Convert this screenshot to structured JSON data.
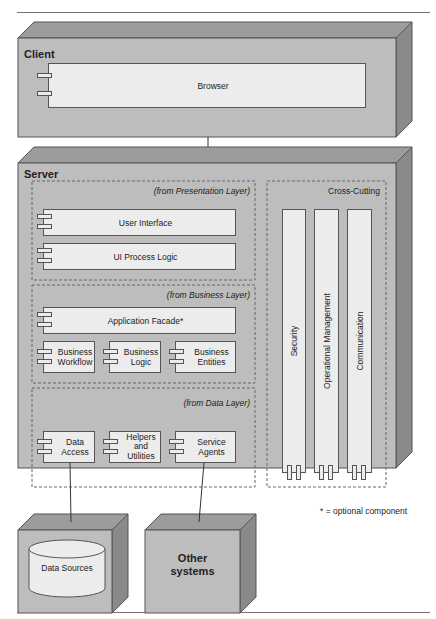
{
  "diagram": {
    "type": "deployment",
    "colors": {
      "node_front": "#bdbdbd",
      "node_top": "#9c9c9c",
      "node_side": "#8a8a8a",
      "component_fill": "#ececec",
      "border": "#555555",
      "dashed": "#666666"
    },
    "client": {
      "title": "Client",
      "components": [
        {
          "label": "Browser"
        }
      ]
    },
    "server": {
      "title": "Server",
      "packages": {
        "presentation": {
          "label": "(from Presentation Layer)",
          "components": [
            {
              "label": "User Interface"
            },
            {
              "label": "UI Process Logic"
            }
          ]
        },
        "business": {
          "label": "(from Business Layer)",
          "components": [
            {
              "label": "Application Facade*"
            },
            {
              "label": "Business Workflow"
            },
            {
              "label": "Business Logic"
            },
            {
              "label": "Business Entities"
            }
          ]
        },
        "data": {
          "label": "(from Data Layer)",
          "components": [
            {
              "label": "Data Access"
            },
            {
              "label": "Helpers and Utilities"
            },
            {
              "label": "Service Agents"
            }
          ]
        },
        "cross_cutting": {
          "label": "Cross-Cutting",
          "components": [
            {
              "label": "Security"
            },
            {
              "label": "Operational Management"
            },
            {
              "label": "Communication"
            }
          ]
        }
      }
    },
    "external": {
      "data_sources": {
        "label": "Data Sources"
      },
      "other_systems": {
        "label_line1": "Other",
        "label_line2": "systems"
      }
    },
    "legend": {
      "text": "* = optional component"
    },
    "text_lines": {
      "business_workflow": [
        "Business",
        "Workflow"
      ],
      "business_logic": [
        "Business",
        "Logic"
      ],
      "business_entities": [
        "Business",
        "Entities"
      ],
      "data_access": [
        "Data",
        "Access"
      ],
      "helpers": [
        "Helpers",
        "and",
        "Utilities"
      ],
      "service_agents": [
        "Service",
        "Agents"
      ]
    },
    "connections": [
      {
        "from": "Client",
        "to": "Server"
      },
      {
        "from": "Data Access",
        "to": "Data Sources"
      },
      {
        "from": "Service Agents",
        "to": "Other systems"
      }
    ]
  }
}
